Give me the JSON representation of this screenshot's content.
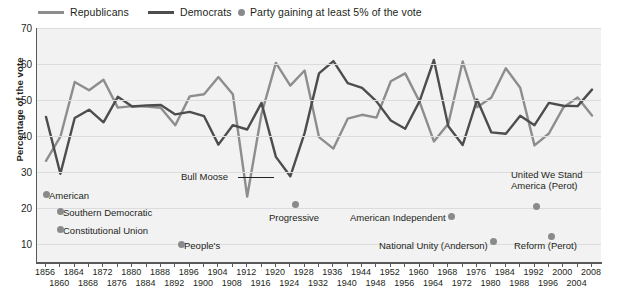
{
  "legend": {
    "items": [
      {
        "label": "Republicans",
        "type": "line",
        "color": "#8d8d8d",
        "x": 38
      },
      {
        "label": "Democrats",
        "type": "line",
        "color": "#4d4d4d",
        "x": 148
      },
      {
        "label": "Party gaining at least 5% of the vote",
        "type": "dot",
        "color": "#8a8a8a",
        "x": 238
      }
    ]
  },
  "axes": {
    "ylabel": "Percentage of the vote",
    "yticks": [
      70,
      60,
      50,
      40,
      30,
      20,
      10
    ],
    "ymin": 5,
    "ymax": 70,
    "xticks": [
      1856,
      1860,
      1864,
      1868,
      1872,
      1876,
      1880,
      1884,
      1888,
      1892,
      1896,
      1900,
      1904,
      1908,
      1912,
      1916,
      1920,
      1924,
      1928,
      1932,
      1936,
      1940,
      1944,
      1948,
      1952,
      1956,
      1960,
      1964,
      1968,
      1972,
      1976,
      1980,
      1984,
      1988,
      1992,
      1996,
      2000,
      2004,
      2008
    ],
    "xrow_top": [
      1856,
      1864,
      1872,
      1880,
      1888,
      1896,
      1904,
      1912,
      1920,
      1928,
      1936,
      1944,
      1952,
      1960,
      1968,
      1976,
      1984,
      1992,
      2000,
      2008
    ],
    "xrow_bottom": [
      1860,
      1868,
      1876,
      1884,
      1892,
      1900,
      1908,
      1916,
      1924,
      1932,
      1940,
      1948,
      1956,
      1964,
      1972,
      1980,
      1988,
      1996,
      2004
    ]
  },
  "annotations": [
    {
      "name": "american",
      "label": "American",
      "tx": 48,
      "ty": 191,
      "dx": 42,
      "dy": 191,
      "dot": "left"
    },
    {
      "name": "southern-democratic",
      "label": "Southern Democratic",
      "tx": 62,
      "ty": 208,
      "dx": 56,
      "dy": 208,
      "dot": "left"
    },
    {
      "name": "constitutional-union",
      "label": "Constitutional Union",
      "tx": 62,
      "ty": 226,
      "dx": 56,
      "dy": 226,
      "dot": "left"
    },
    {
      "name": "bull-moose",
      "label": "Bull Moose",
      "tx": 180,
      "ty": 172,
      "leader": true
    },
    {
      "name": "peoples",
      "label": "People's",
      "tx": 183,
      "ty": 241,
      "dx": 177,
      "dy": 241,
      "dot": "left"
    },
    {
      "name": "progressive",
      "label": "Progressive",
      "tx": 268,
      "ty": 213,
      "dx": 291,
      "dy": 201,
      "dot": "above"
    },
    {
      "name": "american-independent",
      "label": "American Independent",
      "tx": 349,
      "ty": 213,
      "dx": 447,
      "dy": 213,
      "dot": "right"
    },
    {
      "name": "national-unity",
      "label": "National Unity (Anderson)",
      "tx": 378,
      "ty": 241,
      "dx": 489,
      "dy": 238,
      "dot": "right"
    },
    {
      "name": "united-we-stand",
      "label": "United We Stand\nAmerica (Perot)",
      "tx": 510,
      "ty": 170,
      "dx": 532,
      "dy": 203,
      "dot": "below"
    },
    {
      "name": "reform-perot",
      "label": "Reform (Perot)",
      "tx": 513,
      "ty": 241,
      "dx": 547,
      "dy": 233,
      "dot": "above"
    }
  ],
  "chart_data": {
    "type": "line",
    "title": "",
    "xlabel": "",
    "ylabel": "Percentage of the vote",
    "ylim": [
      5,
      70
    ],
    "xlim": [
      1856,
      2008
    ],
    "grid": true,
    "legend_position": "top",
    "x": [
      1856,
      1860,
      1864,
      1868,
      1872,
      1876,
      1880,
      1884,
      1888,
      1892,
      1896,
      1900,
      1904,
      1908,
      1912,
      1916,
      1920,
      1924,
      1928,
      1932,
      1936,
      1940,
      1944,
      1948,
      1952,
      1956,
      1960,
      1964,
      1968,
      1972,
      1976,
      1980,
      1984,
      1988,
      1992,
      1996,
      2000,
      2004,
      2008
    ],
    "series": [
      {
        "name": "Republicans",
        "color": "#8d8d8d",
        "values": [
          33.1,
          39.8,
          55.0,
          52.7,
          55.6,
          47.9,
          48.3,
          48.2,
          47.8,
          43.0,
          51.0,
          51.6,
          56.4,
          51.6,
          23.2,
          46.1,
          60.3,
          54.0,
          58.2,
          39.7,
          36.5,
          44.8,
          45.9,
          45.1,
          55.2,
          57.4,
          49.5,
          38.5,
          43.4,
          60.7,
          48.0,
          50.7,
          58.8,
          53.4,
          37.4,
          40.7,
          47.9,
          50.7,
          45.7
        ]
      },
      {
        "name": "Democrats",
        "color": "#4d4d4d",
        "values": [
          45.3,
          29.5,
          45.0,
          47.3,
          43.8,
          50.9,
          48.2,
          48.5,
          48.6,
          46.0,
          46.7,
          45.5,
          37.6,
          43.0,
          41.8,
          49.2,
          34.2,
          28.8,
          40.8,
          57.4,
          60.8,
          54.7,
          53.4,
          49.6,
          44.3,
          42.0,
          49.7,
          61.1,
          42.7,
          37.5,
          50.1,
          41.0,
          40.6,
          45.6,
          43.0,
          49.2,
          48.4,
          48.3,
          52.9
        ]
      }
    ],
    "third_party_points": [
      {
        "label": "American",
        "year": 1856,
        "value": 21.5
      },
      {
        "label": "Southern Democratic",
        "year": 1860,
        "value": 18.1
      },
      {
        "label": "Constitutional Union",
        "year": 1860,
        "value": 12.6
      },
      {
        "label": "People's",
        "year": 1892,
        "value": 8.5
      },
      {
        "label": "Bull Moose",
        "year": 1912,
        "value": 27.4
      },
      {
        "label": "Progressive",
        "year": 1924,
        "value": 16.6
      },
      {
        "label": "American Independent",
        "year": 1968,
        "value": 13.5
      },
      {
        "label": "National Unity (Anderson)",
        "year": 1980,
        "value": 6.6
      },
      {
        "label": "United We Stand America (Perot)",
        "year": 1992,
        "value": 18.9
      },
      {
        "label": "Reform (Perot)",
        "year": 1996,
        "value": 8.4
      }
    ]
  }
}
